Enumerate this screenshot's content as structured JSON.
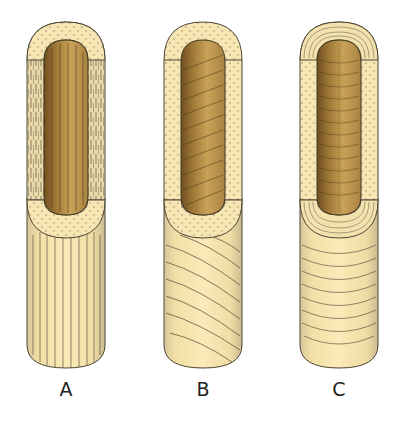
{
  "figure": {
    "colors": {
      "background": "#ffffff",
      "sheath_fill": "#f6e3ad",
      "sheath_light": "#fbefc9",
      "sheath_dot": "#8a7a55",
      "core_dark": "#7a5a25",
      "core_mid": "#b98f44",
      "core_light": "#d7b570",
      "outline": "#4a4535",
      "stroke_lines": "#5c5440"
    },
    "panels": [
      {
        "id": "A",
        "label": "A",
        "orientation": "longitudinal",
        "center_x": 66
      },
      {
        "id": "B",
        "label": "B",
        "orientation": "helical",
        "center_x": 203
      },
      {
        "id": "C",
        "label": "C",
        "orientation": "transverse",
        "center_x": 339
      }
    ]
  }
}
